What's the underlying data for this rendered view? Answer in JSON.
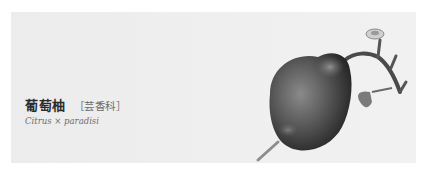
{
  "card": {
    "common_name": "葡萄柚",
    "family": "［芸香科］",
    "scientific_name": "Citrus × paradisi",
    "illustration": {
      "icon": "grapefruit-illustration-icon",
      "description": "Grayscale botanical illustration of a pear-shaped grapefruit with stem, flower bud and leaf"
    }
  },
  "colors": {
    "background": "#ffffff",
    "card_background": "#eeeeee",
    "title": "#2b2b2b",
    "subtitle": "#6a6a6a"
  }
}
